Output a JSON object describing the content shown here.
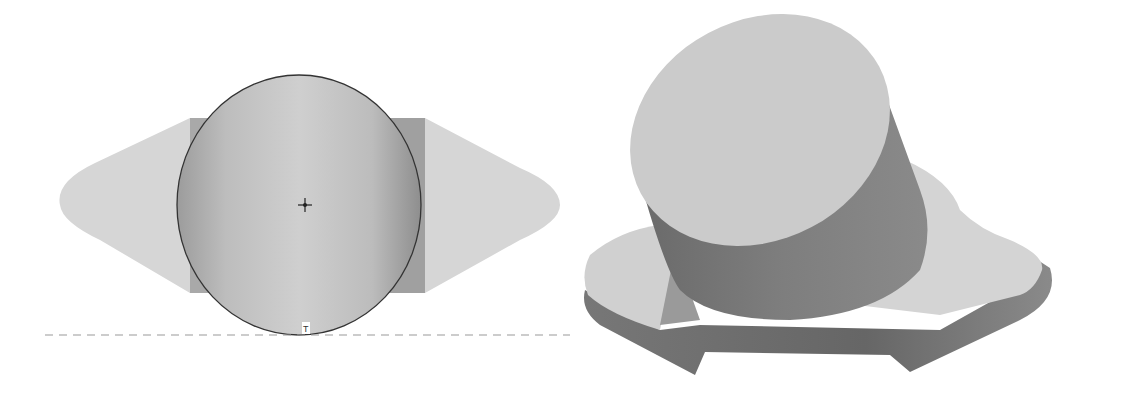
{
  "figure": {
    "left_view": {
      "description": "2D sketch view: circle tangent to a dashed horizontal construction line, over a shaded slot-shaped profile",
      "tangent_marker": "T",
      "center_marker": "center-point",
      "colors": {
        "profile": "#d6d6d6",
        "band": "#a8a8a8",
        "circle_outline": "#333333",
        "dashed_line": "#999999"
      }
    },
    "right_view": {
      "description": "3D shaded model: tilted cylinder standing on an irregular flat base plate",
      "colors": {
        "top_face": "#cccccc",
        "cylinder_side": "#7a7a7a",
        "base_top": "#d2d2d2",
        "base_side": "#6f6f6f"
      }
    }
  }
}
